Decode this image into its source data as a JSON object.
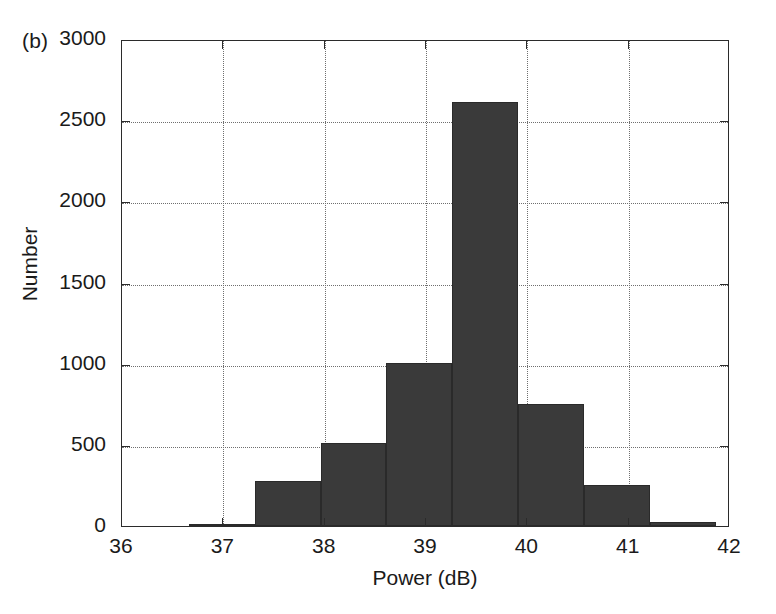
{
  "figure": {
    "panel_label": "(b)",
    "background_color": "#ffffff",
    "axis_color": "#2b2b2b",
    "grid_color": "#6f6f6f",
    "bar_color": "#3a3a3a"
  },
  "chart_data": {
    "type": "bar",
    "subtype": "histogram",
    "title": "",
    "panel": "(b)",
    "xlabel": "Power (dB)",
    "ylabel": "Number",
    "xlim": [
      36,
      42
    ],
    "ylim": [
      0,
      3000
    ],
    "xticks": [
      36,
      37,
      38,
      39,
      40,
      41,
      42
    ],
    "xtick_labels": [
      "36",
      "37",
      "38",
      "39",
      "40",
      "41",
      "42"
    ],
    "yticks": [
      0,
      500,
      1000,
      1500,
      2000,
      2500,
      3000
    ],
    "ytick_labels": [
      "0",
      "500",
      "1000",
      "1500",
      "2000",
      "2500",
      "3000"
    ],
    "grid": true,
    "grid_style": "dotted",
    "legend": null,
    "bin_edges": [
      36.66,
      37.31,
      37.96,
      38.61,
      39.26,
      39.91,
      40.56,
      41.21,
      41.86
    ],
    "bin_centers": [
      36.985,
      37.635,
      38.285,
      38.935,
      39.585,
      40.235,
      40.885,
      41.535
    ],
    "values": [
      15,
      280,
      510,
      1005,
      2610,
      750,
      255,
      25
    ],
    "categories": [
      "36.66-37.31",
      "37.31-37.96",
      "37.96-38.61",
      "38.61-39.26",
      "39.26-39.91",
      "39.91-40.56",
      "40.56-41.21",
      "41.21-41.86"
    ]
  }
}
